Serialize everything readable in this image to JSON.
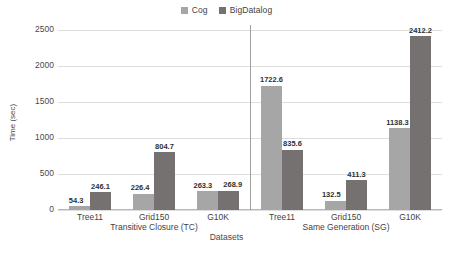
{
  "chart_data": {
    "type": "bar",
    "title": "",
    "xlabel": "Datasets",
    "ylabel": "Time (sec)",
    "ylim": [
      0,
      2500
    ],
    "yticks": [
      0,
      500,
      1000,
      1500,
      2000,
      2500
    ],
    "ytick_labels": [
      "0",
      "500",
      "1000",
      "1500",
      "2000",
      "2500"
    ],
    "grid": true,
    "legend_position": "top-center",
    "categories": [
      "Tree11",
      "Grid150",
      "G10K",
      "Tree11",
      "Grid150",
      "G10K"
    ],
    "group_sections": [
      {
        "label": "Transitive Closure (TC)",
        "categories": [
          "Tree11",
          "Grid150",
          "G10K"
        ]
      },
      {
        "label": "Same Generation (SG)",
        "categories": [
          "Tree11",
          "Grid150",
          "G10K"
        ]
      }
    ],
    "series": [
      {
        "name": "Cog",
        "color": "#a6a6a6",
        "values": [
          54.3,
          226.4,
          263.3,
          1722.6,
          132.5,
          1138.3
        ]
      },
      {
        "name": "BigDatalog",
        "color": "#767171",
        "values": [
          246.1,
          804.7,
          268.9,
          835.6,
          411.3,
          2412.2
        ]
      }
    ],
    "value_labels": [
      [
        "54.3",
        "226.4",
        "263.3",
        "1722.6",
        "132.5",
        "1138.3"
      ],
      [
        "246.1",
        "804.7",
        "268.9",
        "835.6",
        "411.3",
        "2412.2"
      ]
    ]
  },
  "colors": {
    "cog": "#a6a6a6",
    "bigdatalog": "#767171",
    "gridline": "#dedede",
    "axis": "#b8b8b8",
    "separator": "#a0a0a0",
    "text": "#4a4a4a",
    "background": "#ffffff"
  }
}
